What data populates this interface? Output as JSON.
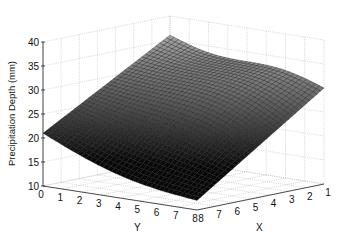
{
  "chart_data": {
    "type": "surface",
    "title": "",
    "xlabel": "X",
    "ylabel": "Y",
    "zlabel": "Precipitation Depth (mm)",
    "x_ticks": [
      "1",
      "2",
      "3",
      "4",
      "5",
      "6",
      "7",
      "8"
    ],
    "y_ticks": [
      "0",
      "1",
      "2",
      "3",
      "4",
      "5",
      "6",
      "7",
      "8"
    ],
    "z_ticks": [
      "10",
      "15",
      "20",
      "25",
      "30",
      "35",
      "40"
    ],
    "xlim": [
      1,
      8
    ],
    "ylim": [
      0,
      8
    ],
    "zlim": [
      10,
      40
    ],
    "grid": true,
    "colormap": "gray",
    "surface_corners": {
      "x1_y0": 36,
      "x8_y0": 21,
      "x1_y8": 30,
      "x8_y8": 12
    }
  }
}
